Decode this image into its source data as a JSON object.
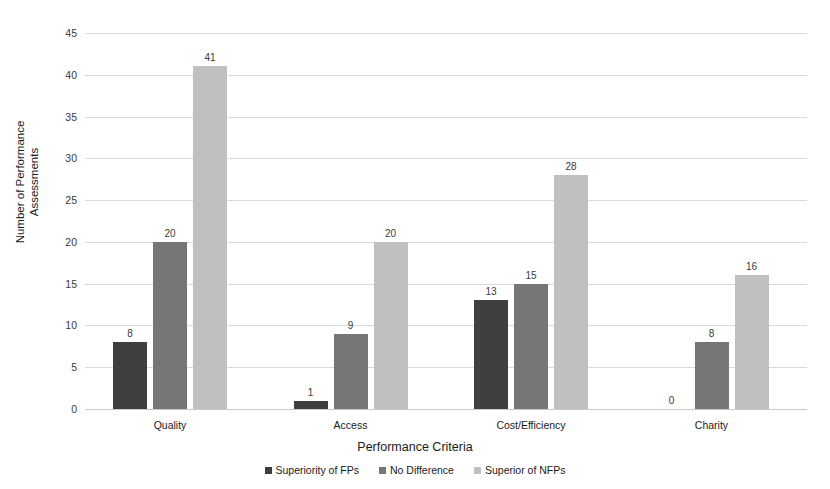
{
  "chart_data": {
    "type": "bar",
    "title": "",
    "xlabel": "Performance Criteria",
    "ylabel": "Number of Performance Assessments",
    "categories": [
      "Quality",
      "Access",
      "Cost/Efficiency",
      "Charity"
    ],
    "series": [
      {
        "name": "Superiority of FPs",
        "color": "#3f3f3f",
        "values": [
          8,
          1,
          13,
          0
        ]
      },
      {
        "name": "No Difference",
        "color": "#767676",
        "values": [
          20,
          9,
          15,
          8
        ]
      },
      {
        "name": "Superior of NFPs",
        "color": "#c0c0c0",
        "values": [
          41,
          20,
          28,
          16
        ]
      }
    ],
    "ylim": [
      0,
      45
    ],
    "yticks": [
      45,
      40,
      35,
      30,
      25,
      20,
      15,
      10,
      5,
      0
    ],
    "grid": true,
    "legend_position": "bottom",
    "data_labels": true
  },
  "axis": {
    "y_title_line1": "Number of Performance",
    "y_title_line2": "Assessments",
    "x_title": "Performance Criteria"
  }
}
